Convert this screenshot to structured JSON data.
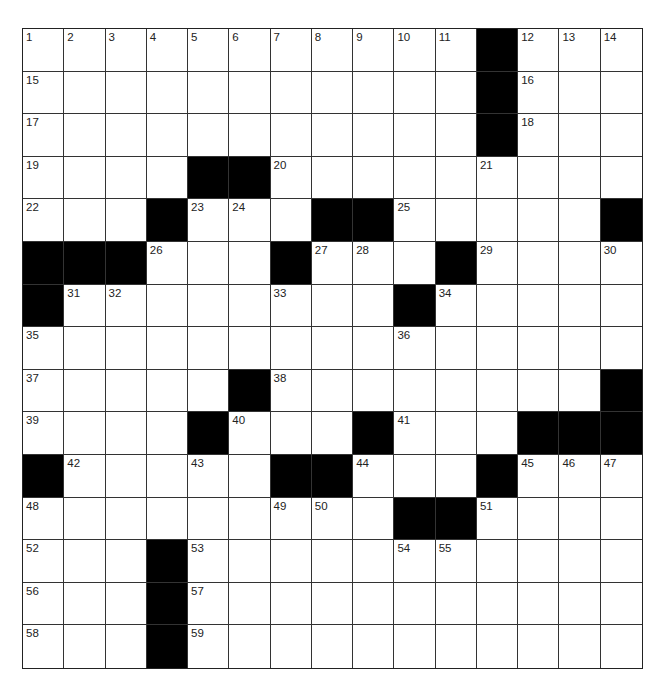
{
  "puzzle": {
    "rows": 15,
    "cols": 15,
    "colors": {
      "block": "#000000",
      "cell": "#ffffff",
      "line": "#333333",
      "number": "#222222"
    },
    "layout": [
      "...........",
      "x"
    ],
    "grid": [
      [
        "1",
        "2",
        "3",
        "4",
        "5",
        "6",
        "7",
        "8",
        "9",
        "10",
        "11",
        "#",
        "12",
        "13",
        "14"
      ],
      [
        "15",
        ".",
        ".",
        ".",
        ".",
        ".",
        ".",
        ".",
        ".",
        ".",
        ".",
        "#",
        "16",
        ".",
        "."
      ],
      [
        "17",
        ".",
        ".",
        ".",
        ".",
        ".",
        ".",
        ".",
        ".",
        ".",
        ".",
        "#",
        "18",
        ".",
        "."
      ],
      [
        "19",
        ".",
        ".",
        ".",
        "#",
        "#",
        "20",
        ".",
        ".",
        ".",
        ".",
        "21",
        ".",
        ".",
        "."
      ],
      [
        "22",
        ".",
        ".",
        "#",
        "23",
        "24",
        ".",
        "#",
        "#",
        "25",
        ".",
        ".",
        ".",
        ".",
        "#"
      ],
      [
        "#",
        "#",
        "#",
        "26",
        ".",
        ".",
        "#",
        "27",
        "28",
        ".",
        "#",
        "29",
        ".",
        ".",
        "30"
      ],
      [
        "#",
        "31",
        "32",
        ".",
        ".",
        ".",
        "33",
        ".",
        ".",
        "#",
        "34",
        ".",
        ".",
        ".",
        "."
      ],
      [
        "35",
        ".",
        ".",
        ".",
        ".",
        ".",
        ".",
        ".",
        ".",
        "36",
        ".",
        ".",
        ".",
        ".",
        "."
      ],
      [
        "37",
        ".",
        ".",
        ".",
        ".",
        "#",
        "38",
        ".",
        ".",
        ".",
        ".",
        ".",
        ".",
        ".",
        "#"
      ],
      [
        "39",
        ".",
        ".",
        ".",
        "#",
        "40",
        ".",
        ".",
        "#",
        "41",
        ".",
        ".",
        "#",
        "#",
        "#"
      ],
      [
        "#",
        "42",
        ".",
        ".",
        "43",
        ".",
        "#",
        "#",
        "44",
        ".",
        ".",
        "#",
        "45",
        "46",
        "47"
      ],
      [
        "48",
        ".",
        ".",
        ".",
        ".",
        ".",
        "49",
        "50",
        ".",
        "#",
        "#",
        "51",
        ".",
        ".",
        "."
      ],
      [
        "52",
        ".",
        ".",
        "#",
        "53",
        ".",
        ".",
        ".",
        ".",
        "54",
        "55",
        ".",
        ".",
        ".",
        "."
      ],
      [
        "56",
        ".",
        ".",
        "#",
        "57",
        ".",
        ".",
        ".",
        ".",
        ".",
        ".",
        ".",
        ".",
        ".",
        "."
      ],
      [
        "58",
        ".",
        ".",
        "#",
        "59",
        ".",
        ".",
        ".",
        ".",
        ".",
        ".",
        ".",
        ".",
        ".",
        "."
      ]
    ]
  }
}
